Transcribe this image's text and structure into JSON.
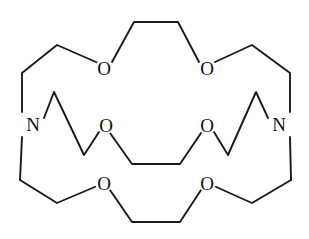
{
  "figure": {
    "name": "cryptand-structure",
    "background_color": "#ffffff",
    "bond_color": "#1a1a1a",
    "label_color": "#111111",
    "width": 309,
    "height": 239
  },
  "atoms": [
    {
      "id": "O-top-left",
      "label": "O",
      "x": 104,
      "y": 68,
      "element": "oxygen"
    },
    {
      "id": "O-top-right",
      "label": "O",
      "x": 207,
      "y": 68,
      "element": "oxygen"
    },
    {
      "id": "N-left",
      "label": "N",
      "x": 33,
      "y": 124,
      "element": "nitrogen"
    },
    {
      "id": "N-right",
      "label": "N",
      "x": 279,
      "y": 124,
      "element": "nitrogen"
    },
    {
      "id": "O-middle-left",
      "label": "O",
      "x": 106,
      "y": 125,
      "element": "oxygen"
    },
    {
      "id": "O-middle-right",
      "label": "O",
      "x": 207,
      "y": 125,
      "element": "oxygen"
    },
    {
      "id": "O-bottom-left",
      "label": "O",
      "x": 104,
      "y": 183,
      "element": "oxygen"
    },
    {
      "id": "O-bottom-right",
      "label": "O",
      "x": 207,
      "y": 183,
      "element": "oxygen"
    }
  ],
  "bonds": [
    {
      "id": "chain-top",
      "name": "upper-bridge-chain",
      "points": "22,73 57,45 96,62 104,68"
    },
    {
      "id": "chain-top-center",
      "name": "upper-bridge-center",
      "points": "112,62 134,22 178,22 199,62"
    },
    {
      "id": "chain-top-right",
      "name": "upper-bridge-chain-right",
      "points": "215,62 252,45 290,73"
    },
    {
      "id": "chain-left-upper",
      "name": "left-nitrogen-up-arm",
      "points": "22,73 22,112"
    },
    {
      "id": "chain-left-lower",
      "name": "left-nitrogen-down-arm",
      "points": "22,137 20,180"
    },
    {
      "id": "chain-right-upper",
      "name": "right-nitrogen-up-arm",
      "points": "290,73 290,112"
    },
    {
      "id": "chain-right-lower",
      "name": "right-nitrogen-down-arm",
      "points": "290,137 291,180"
    },
    {
      "id": "chain-mid-left",
      "name": "middle-bridge-left-zigzag",
      "points": "44,118 54,92 84,155 99,132"
    },
    {
      "id": "chain-mid-right",
      "name": "middle-bridge-right-zigzag",
      "points": "268,118 256,92 228,155 214,132"
    },
    {
      "id": "chain-mid-center",
      "name": "middle-bridge-center",
      "points": "110,133 132,164 180,164 201,133"
    },
    {
      "id": "chain-bot-left",
      "name": "lower-bridge-chain-left",
      "points": "20,180 57,203 97,186"
    },
    {
      "id": "chain-bot-center",
      "name": "lower-bridge-center",
      "points": "110,190 132,222 180,222 201,190"
    },
    {
      "id": "chain-bot-right",
      "name": "lower-bridge-chain-right",
      "points": "214,186 252,203 291,180"
    }
  ]
}
